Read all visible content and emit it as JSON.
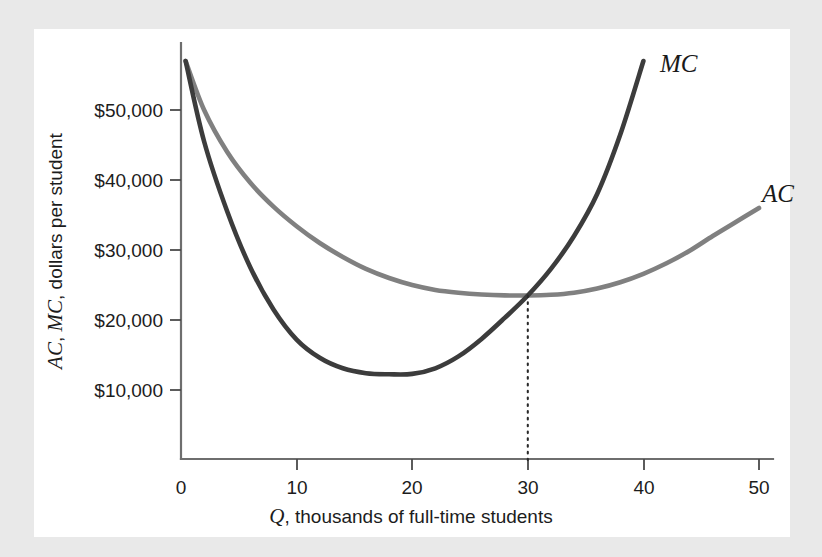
{
  "figure": {
    "background_color": "#e9e9e9",
    "panel_color": "#ffffff"
  },
  "chart_data": {
    "type": "line",
    "title": "",
    "subtitle": "",
    "xlabel_italic": "Q",
    "xlabel_rest": ", thousands of full-time students",
    "xlabel_full": "Q, thousands of full-time students",
    "ylabel_italic_1": "AC",
    "ylabel_sep_1": ", ",
    "ylabel_italic_2": "MC",
    "ylabel_rest": ", dollars per student",
    "ylabel_full": "AC, MC, dollars per student",
    "x": [
      0,
      10,
      20,
      30,
      40,
      50
    ],
    "xticklabels": [
      "0",
      "10",
      "20",
      "30",
      "40",
      "50"
    ],
    "yticks": [
      10000,
      20000,
      30000,
      40000,
      50000
    ],
    "yticklabels": [
      "$10,000",
      "$20,000",
      "$30,000",
      "$40,000",
      "$50,000"
    ],
    "xlim": [
      0,
      52
    ],
    "ylim": [
      0,
      60000
    ],
    "grid": false,
    "legend": "inline-curve-labels",
    "series": [
      {
        "name": "MC",
        "label": "MC",
        "color": "#3c3c3c",
        "points": [
          [
            0.4,
            57000
          ],
          [
            2,
            45500
          ],
          [
            4,
            35500
          ],
          [
            6,
            27500
          ],
          [
            8,
            21500
          ],
          [
            10,
            17200
          ],
          [
            12,
            14600
          ],
          [
            14,
            13100
          ],
          [
            16,
            12400
          ],
          [
            18,
            12250
          ],
          [
            20,
            12300
          ],
          [
            22,
            13100
          ],
          [
            24,
            14800
          ],
          [
            26,
            17300
          ],
          [
            28,
            20300
          ],
          [
            30,
            23500
          ],
          [
            32,
            27300
          ],
          [
            34,
            32000
          ],
          [
            36,
            38000
          ],
          [
            38,
            46500
          ],
          [
            40,
            57000
          ]
        ],
        "notable": {
          "minimum_q": 20,
          "minimum_value": 12300,
          "end_q": 40,
          "end_value": 57000
        }
      },
      {
        "name": "AC",
        "label": "AC",
        "color": "#808080",
        "points": [
          [
            0.4,
            57000
          ],
          [
            2,
            50000
          ],
          [
            4,
            44000
          ],
          [
            6,
            39600
          ],
          [
            8,
            36200
          ],
          [
            10,
            33400
          ],
          [
            12,
            31000
          ],
          [
            14,
            29000
          ],
          [
            16,
            27300
          ],
          [
            18,
            26000
          ],
          [
            20,
            25000
          ],
          [
            22,
            24300
          ],
          [
            24,
            23900
          ],
          [
            26,
            23650
          ],
          [
            28,
            23520
          ],
          [
            30,
            23500
          ],
          [
            32,
            23600
          ],
          [
            34,
            23900
          ],
          [
            36,
            24500
          ],
          [
            38,
            25400
          ],
          [
            40,
            26600
          ],
          [
            42,
            28100
          ],
          [
            44,
            29900
          ],
          [
            46,
            32000
          ],
          [
            48,
            34000
          ],
          [
            50,
            36000
          ]
        ],
        "notable": {
          "minimum_q": 30,
          "minimum_value": 23500,
          "end_q": 50,
          "end_value": 36000
        }
      }
    ],
    "annotations": [
      {
        "name": "intersection-dropline",
        "type": "dotted-vertical",
        "x": 30,
        "y_top": 23500,
        "y_bottom": 0,
        "description": "Dotted vertical line from MC-AC intersection (minimum of AC) down to the horizontal axis at Q = 30"
      }
    ]
  }
}
